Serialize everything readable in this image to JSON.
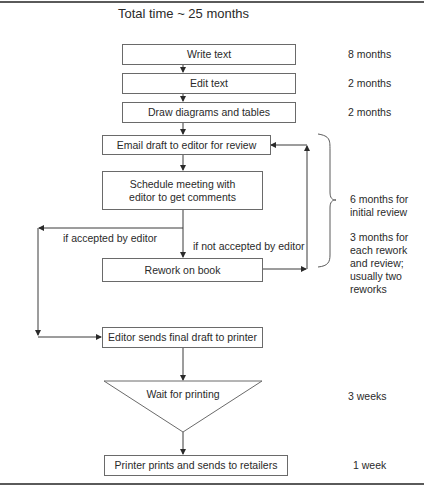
{
  "diagram": {
    "title": "Total time ~ 25 months",
    "steps": [
      {
        "id": "write",
        "label": "Write text",
        "duration": "8 months"
      },
      {
        "id": "edit",
        "label": "Edit text",
        "duration": "2 months"
      },
      {
        "id": "draw",
        "label": "Draw diagrams and tables",
        "duration": "2 months"
      },
      {
        "id": "email",
        "label": "Email draft to editor for review"
      },
      {
        "id": "schedule",
        "label": "Schedule meeting with editor to get comments"
      },
      {
        "id": "rework",
        "label": "Rework on book"
      },
      {
        "id": "final",
        "label": "Editor sends final draft to printer"
      },
      {
        "id": "wait",
        "label": "Wait for printing",
        "duration": "3 weeks",
        "shape": "inverted-triangle"
      },
      {
        "id": "print",
        "label": "Printer prints and sends to retailers",
        "duration": "1 week"
      }
    ],
    "branches": {
      "accepted": "if accepted by editor",
      "not_accepted": "if not accepted by editor"
    },
    "review_note": {
      "initial": "6 months for initial review",
      "rework": "3 months for each rework and review; usually two reworks"
    },
    "colors": {
      "line": "#3a3a3a",
      "box_border": "#6a6a6a",
      "text": "#2a2a2a",
      "rule": "#5a5a5a"
    }
  }
}
